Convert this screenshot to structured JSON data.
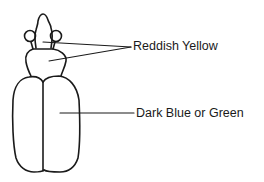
{
  "diagram": {
    "labels": [
      {
        "id": "reddish-yellow",
        "text": "Reddish Yellow",
        "points_to": [
          "head",
          "pronotum"
        ]
      },
      {
        "id": "dark-blue-or-green",
        "text": "Dark Blue or Green",
        "points_to": [
          "elytra"
        ]
      }
    ],
    "colors": {
      "line": "#1a1a1a",
      "background": "#ffffff"
    }
  }
}
